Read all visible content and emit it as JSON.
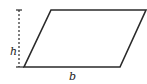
{
  "diagram": {
    "shape": "parallelogram",
    "labels": {
      "height": "h",
      "base": "b"
    },
    "colors": {
      "stroke": "#2a2a2a",
      "text": "#222222",
      "background": "#ffffff"
    }
  }
}
